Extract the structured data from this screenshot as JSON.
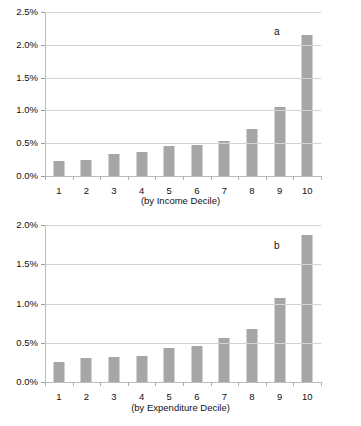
{
  "figure": {
    "background": "#ffffff",
    "bar_color": "#a6a6a6",
    "gridline_color": "#d3d3d3",
    "axis_color": "#bdbdbd"
  },
  "chart_data": [
    {
      "type": "bar",
      "panel_tag": "a",
      "title": "",
      "subtitle": "",
      "xlabel": "(by Income Decile)",
      "ylabel": "",
      "categories": [
        "1",
        "2",
        "3",
        "4",
        "5",
        "6",
        "7",
        "8",
        "9",
        "10"
      ],
      "values": [
        0.23,
        0.24,
        0.34,
        0.36,
        0.45,
        0.48,
        0.54,
        0.72,
        1.05,
        2.15
      ],
      "value_unit": "percent",
      "ylim": [
        0,
        2.5
      ],
      "ytick_values": [
        0.0,
        0.5,
        1.0,
        1.5,
        2.0,
        2.5
      ],
      "ytick_labels": [
        "0.0%",
        "0.5%",
        "1.0%",
        "1.5%",
        "2.0%",
        "2.5%"
      ],
      "grid": true,
      "grid_axis": "y",
      "legend": null
    },
    {
      "type": "bar",
      "panel_tag": "b",
      "title": "",
      "subtitle": "",
      "xlabel": "(by Expenditure Decile)",
      "ylabel": "",
      "categories": [
        "1",
        "2",
        "3",
        "4",
        "5",
        "6",
        "7",
        "8",
        "9",
        "10"
      ],
      "values": [
        0.25,
        0.31,
        0.32,
        0.33,
        0.43,
        0.46,
        0.56,
        0.68,
        1.07,
        1.87
      ],
      "value_unit": "percent",
      "ylim": [
        0,
        2.0
      ],
      "ytick_values": [
        0.0,
        0.5,
        1.0,
        1.5,
        2.0
      ],
      "ytick_labels": [
        "0.0%",
        "0.5%",
        "1.0%",
        "1.5%",
        "2.0%"
      ],
      "grid": true,
      "grid_axis": "y",
      "legend": null
    }
  ]
}
